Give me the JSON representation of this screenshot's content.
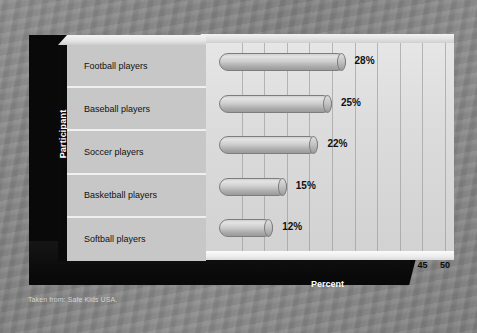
{
  "chart_data": {
    "type": "bar",
    "orientation": "horizontal",
    "title": "",
    "xlabel": "Percent",
    "ylabel": "Participant",
    "categories": [
      "Football players",
      "Baseball players",
      "Soccer players",
      "Basketball players",
      "Softball players"
    ],
    "values": [
      28,
      25,
      22,
      15,
      12
    ],
    "value_labels": [
      "28%",
      "25%",
      "22%",
      "15%",
      "12%"
    ],
    "xlim": [
      0,
      50
    ],
    "xticks": [
      0,
      5,
      10,
      15,
      20,
      25,
      30,
      35,
      40,
      45,
      50
    ],
    "xtick_labels": [
      "0",
      "5",
      "10",
      "15",
      "20",
      "25",
      "30",
      "35",
      "40",
      "45",
      "50"
    ],
    "grid": "vertical",
    "legend": "none",
    "style": "3d-cylinder-bars"
  },
  "caption": {
    "source_note": "Taken from: Safe Kids USA."
  },
  "colors": {
    "backdrop": "#878787",
    "slab": "#090909",
    "panel": "#c7c7c7",
    "wall": "#dcdcdc",
    "bar_light": "#e3e3e3",
    "bar_dark": "#9a9a9a",
    "text_dark": "#101010",
    "text_light": "#ffffff"
  }
}
